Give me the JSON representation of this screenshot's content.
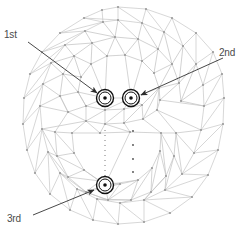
{
  "figure": {
    "background_color": "#ffffff",
    "mesh_line_color": "#c9c9c9",
    "mesh_inner_line_color": "#bdbdbd",
    "mesh_vertex_color": "#9a9a9a",
    "marker_color": "#1a1a1a",
    "arrow_color": "#333333",
    "label_color": "#4a4a4a",
    "width": 246,
    "height": 250
  },
  "annotations": [
    {
      "id": "first",
      "label": "1st",
      "label_x": 4,
      "label_y": 30,
      "arrow_from_x": 28,
      "arrow_from_y": 42,
      "arrow_to_x": 97,
      "arrow_to_y": 93,
      "marker_x": 105,
      "marker_y": 98
    },
    {
      "id": "second",
      "label": "2nd",
      "label_x": 219,
      "label_y": 48,
      "arrow_from_x": 223,
      "arrow_from_y": 58,
      "arrow_to_x": 140,
      "arrow_to_y": 95,
      "marker_x": 131,
      "marker_y": 98
    },
    {
      "id": "third",
      "label": "3rd",
      "label_x": 7,
      "label_y": 214,
      "arrow_from_x": 33,
      "arrow_from_y": 215,
      "arrow_to_x": 95,
      "arrow_to_y": 190,
      "marker_x": 105,
      "marker_y": 185
    }
  ],
  "markers": {
    "outer_radius": 8.5,
    "inner_radius": 6.0,
    "dot_radius": 1.8
  },
  "caption": {
    "text": ""
  }
}
